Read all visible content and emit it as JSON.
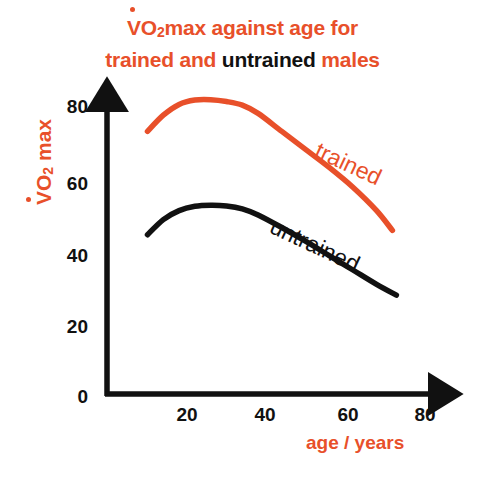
{
  "chart_data": {
    "type": "line",
    "title_parts": [
      {
        "text": "V",
        "color": "#E8502A",
        "dot_above": true
      },
      {
        "text": "O",
        "color": "#E8502A"
      },
      {
        "text": "2",
        "color": "#E8502A",
        "sub": true
      },
      {
        "text": "max against age for",
        "color": "#E8502A"
      },
      {
        "text": "trained and ",
        "color": "#E8502A",
        "line2": true
      },
      {
        "text": "untrained",
        "color": "#111111",
        "line2": true
      },
      {
        "text": " males",
        "color": "#E8502A",
        "line2": true
      }
    ],
    "title_line1": "VO2max against age for",
    "title_line2_a": "trained and ",
    "title_line2_b": "untrained",
    "title_line2_c": " males",
    "xlabel": "age / years",
    "ylabel": "VO2 max",
    "ylabel_prefix": "V",
    "ylabel_rest": "O",
    "ylabel_sub": "2",
    "ylabel_suffix": " max",
    "xticks": [
      20,
      40,
      60,
      80
    ],
    "yticks": [
      0,
      20,
      40,
      60,
      80
    ],
    "xlim": [
      0,
      85
    ],
    "ylim": [
      0,
      88
    ],
    "grid": false,
    "legend": "inline-annotations",
    "colors": {
      "trained": "#E8502A",
      "untrained": "#111111",
      "axis": "#111111",
      "background": "#ffffff"
    },
    "series": [
      {
        "name": "trained",
        "color": "#E8502A",
        "label": "trained",
        "x": [
          10,
          14,
          18,
          22,
          26,
          30,
          34,
          38,
          44,
          50,
          56,
          62,
          68,
          72
        ],
        "y": [
          73.5,
          78.0,
          81.0,
          82.2,
          82.3,
          81.8,
          80.8,
          78.5,
          73.5,
          68.5,
          63.5,
          58.0,
          51.5,
          46.0
        ]
      },
      {
        "name": "untrained",
        "color": "#111111",
        "label": "untrained",
        "x": [
          10,
          14,
          18,
          22,
          26,
          30,
          34,
          38,
          44,
          50,
          56,
          62,
          68,
          73
        ],
        "y": [
          44.8,
          49.0,
          51.5,
          52.7,
          53.0,
          52.8,
          52.0,
          50.3,
          46.8,
          43.0,
          39.0,
          35.0,
          31.0,
          28.0
        ]
      }
    ]
  }
}
